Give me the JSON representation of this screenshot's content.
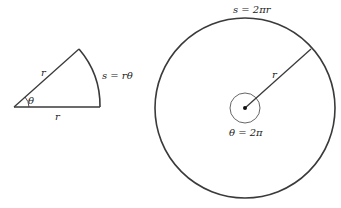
{
  "figure": {
    "sector": {
      "radius_label_upper": "r",
      "radius_label_lower": "r",
      "angle_label": "θ",
      "arc_label": "s = rθ"
    },
    "circle": {
      "arc_label": "s = 2πr",
      "radius_label": "r",
      "angle_label": "θ = 2π"
    }
  },
  "colors": {
    "stroke": "#3a3a3a",
    "text": "#222222",
    "background": "#ffffff"
  }
}
